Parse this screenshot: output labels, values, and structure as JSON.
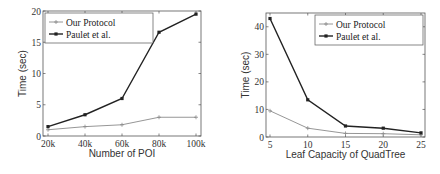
{
  "chart_data": [
    {
      "type": "line",
      "title": "",
      "xlabel": "Number of POI",
      "ylabel": "Time (sec)",
      "categories": [
        "20k",
        "40k",
        "60k",
        "80k",
        "100k"
      ],
      "ylim": [
        0,
        20
      ],
      "yticks": [
        0,
        5,
        10,
        15,
        20
      ],
      "grid": false,
      "legend_position": "upper left",
      "series": [
        {
          "name": "Our Protocol",
          "values": [
            1.0,
            1.5,
            1.8,
            3.0,
            3.0
          ],
          "color": "#8a8a8a",
          "marker": "+"
        },
        {
          "name": "Paulet et al.",
          "values": [
            1.5,
            3.4,
            6.0,
            16.6,
            19.5
          ],
          "color": "#222222",
          "marker": "square"
        }
      ]
    },
    {
      "type": "line",
      "title": "",
      "xlabel": "Leaf Capacity of QuadTree",
      "ylabel": "Time (sec)",
      "categories": [
        "5",
        "10",
        "15",
        "20",
        "25"
      ],
      "ylim": [
        0,
        45
      ],
      "yticks": [
        0,
        10,
        20,
        30,
        40
      ],
      "grid": false,
      "legend_position": "upper right",
      "series": [
        {
          "name": "Our Protocol",
          "values": [
            9.5,
            3.2,
            1.3,
            1.2,
            0.8
          ],
          "color": "#8a8a8a",
          "marker": "+"
        },
        {
          "name": "Paulet et al.",
          "values": [
            43,
            13.5,
            4.0,
            3.2,
            1.5
          ],
          "color": "#222222",
          "marker": "square"
        }
      ]
    }
  ]
}
